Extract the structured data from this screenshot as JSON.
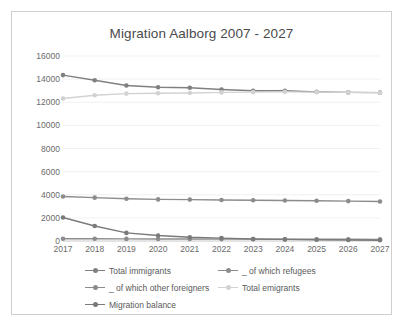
{
  "chart_data": {
    "type": "line",
    "title": "Migration Aalborg 2007 - 2027",
    "xlabel": "",
    "ylabel": "",
    "categories": [
      "2017",
      "2018",
      "2019",
      "2020",
      "2021",
      "2022",
      "2023",
      "2024",
      "2025",
      "2026",
      "2027"
    ],
    "ylim": [
      0,
      16000
    ],
    "ytick_step": 2000,
    "yticks": [
      "16000",
      "14000",
      "12000",
      "10000",
      "8000",
      "6000",
      "4000",
      "2000",
      "0"
    ],
    "grid": true,
    "legend_position": "bottom",
    "series": [
      {
        "name": "Total immigrants",
        "color": "#808080",
        "values": [
          14350,
          13900,
          13450,
          13300,
          13250,
          13100,
          13000,
          13000,
          12900,
          12850,
          12830
        ]
      },
      {
        "name": "_ of which refugees",
        "color": "#8c8c8c",
        "values": [
          200,
          190,
          180,
          175,
          170,
          165,
          160,
          155,
          150,
          145,
          140
        ]
      },
      {
        "name": "_ of which other foreigners",
        "color": "#8c8c8c",
        "values": [
          3850,
          3750,
          3650,
          3600,
          3580,
          3550,
          3520,
          3500,
          3480,
          3450,
          3420
        ]
      },
      {
        "name": "Total emigrants",
        "color": "#d2d2d2",
        "values": [
          12320,
          12600,
          12750,
          12780,
          12800,
          12850,
          12880,
          12900,
          12880,
          12850,
          12830
        ]
      },
      {
        "name": "Migration balance",
        "color": "#7a7a7a",
        "values": [
          2030,
          1300,
          700,
          480,
          330,
          250,
          170,
          140,
          110,
          90,
          70
        ]
      }
    ]
  },
  "legend": {
    "rows": [
      [
        {
          "label": "Total immigrants",
          "color": "#808080"
        },
        {
          "label": "_ of which refugees",
          "color": "#8c8c8c"
        }
      ],
      [
        {
          "label": "_ of which other foreigners",
          "color": "#8c8c8c"
        },
        {
          "label": "Total emigrants",
          "color": "#d2d2d2"
        }
      ],
      [
        {
          "label": "Migration balance",
          "color": "#7a7a7a"
        }
      ]
    ]
  }
}
